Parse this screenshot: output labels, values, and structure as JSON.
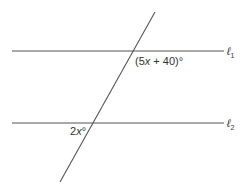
{
  "diagram": {
    "lines": [
      {
        "name": "l1",
        "label": "ℓ",
        "subscript": "1",
        "y": 51,
        "x1": 12,
        "x2": 224
      },
      {
        "name": "l2",
        "label": "ℓ",
        "subscript": "2",
        "y": 123,
        "x1": 12,
        "x2": 224
      }
    ],
    "transversal": {
      "x1": 155,
      "y1": 12,
      "x2": 60,
      "y2": 182
    },
    "angles": [
      {
        "name": "angle-top",
        "pre": "(5",
        "var": "x",
        "post": " + 40)°"
      },
      {
        "name": "angle-bottom",
        "pre": "2",
        "var": "x",
        "post": "°"
      }
    ]
  }
}
